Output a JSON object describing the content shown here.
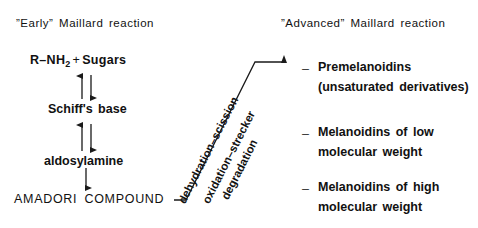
{
  "diagram": {
    "headers": {
      "early": "”Early”  Maillard  reaction",
      "advanced": "”Advanced”  Maillard  reaction"
    },
    "early_pathway": {
      "reactant_label": "R–NH",
      "reactant_subscript": "2",
      "plus": "+",
      "sugars": "Sugars",
      "schiff": "Schiff's  base",
      "aldosylamine": "aldosylamine",
      "amadori": "AMADORI  COMPOUND"
    },
    "transformation_labels": [
      "dehydration–scission",
      "oxidation–strecker",
      "degradation"
    ],
    "advanced_products": [
      {
        "bullet": "–",
        "line1": "Premelanoidins",
        "line2": "(unsaturated  derivatives)"
      },
      {
        "bullet": "–",
        "line1": "Melanoidins  of  low",
        "line2": "molecular  weight"
      },
      {
        "bullet": "–",
        "line1": "Melanoidins  of  high",
        "line2": "molecular  weight"
      }
    ],
    "colors": {
      "background": "#ffffff",
      "ink": "#111111",
      "line": "#1a1a1a"
    }
  }
}
